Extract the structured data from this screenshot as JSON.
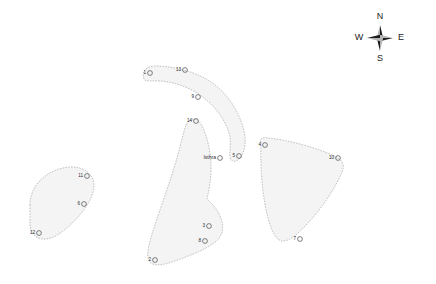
{
  "map": {
    "background_color": "#ffffff",
    "region_fill_color": "#f4f4f4",
    "region_stroke_color": "#a8a8a8",
    "marker_stroke_color": "#4a4a4a",
    "label_color": "#2a2a2a",
    "regions": [
      {
        "name": "west-oval-region",
        "path": "M 30 205 C 30 186 45 172 63 168 C 80 164 93 172 94 184 C 95 198 80 218 62 232 C 46 244 32 240 30 226 Z"
      },
      {
        "name": "north-arc-region",
        "path": "M 144 79 C 141 72 146 66 155 66 C 170 66 191 70 208 80 C 226 91 238 110 243 127 C 247 140 245 152 240 158 C 236 163 231 162 230 157 C 229 150 232 143 229 133 C 225 119 213 103 197 93 C 181 83 163 80 150 81 C 147 81 145 81 144 79 Z"
      },
      {
        "name": "central-peninsula-region",
        "path": "M 186 125 C 190 117 197 117 201 124 C 207 135 211 152 211 168 C 211 180 209 190 207 199 C 214 205 220 213 222 222 C 224 231 221 238 214 243 C 203 251 186 257 172 262 C 160 266 152 266 149 261 C 146 255 149 243 154 228 C 160 209 168 188 174 168 C 180 149 183 133 186 125 Z"
      },
      {
        "name": "east-triangle-region",
        "path": "M 261 142 C 259 139 262 137 268 138 C 288 140 315 147 334 156 C 343 160 345 165 342 172 C 336 187 322 208 308 223 C 297 235 288 242 282 241 C 276 240 272 232 268 218 C 263 199 260 172 261 142 Z"
      }
    ],
    "markers": [
      {
        "id": "1",
        "label": "1",
        "cx": 150,
        "cy": 73,
        "lx": 146,
        "ly": 73
      },
      {
        "id": "13",
        "label": "13",
        "cx": 185,
        "cy": 70,
        "lx": 181,
        "ly": 70
      },
      {
        "id": "9",
        "label": "9",
        "cx": 198,
        "cy": 97,
        "lx": 194,
        "ly": 97
      },
      {
        "id": "14",
        "label": "14",
        "cx": 196,
        "cy": 121,
        "lx": 192,
        "ly": 121
      },
      {
        "id": "5",
        "label": "5",
        "cx": 239,
        "cy": 156,
        "lx": 235,
        "ly": 156
      },
      {
        "id": "4",
        "label": "4",
        "cx": 265,
        "cy": 145,
        "lx": 261,
        "ly": 145
      },
      {
        "id": "10",
        "label": "10",
        "cx": 338,
        "cy": 158,
        "lx": 334,
        "ly": 158
      },
      {
        "id": "7",
        "label": "7",
        "cx": 300,
        "cy": 239,
        "lx": 296,
        "ly": 239
      },
      {
        "id": "11",
        "label": "11",
        "cx": 87,
        "cy": 176,
        "lx": 83,
        "ly": 176
      },
      {
        "id": "6",
        "label": "6",
        "cx": 84,
        "cy": 204,
        "lx": 80,
        "ly": 204
      },
      {
        "id": "12",
        "label": "12",
        "cx": 39,
        "cy": 233,
        "lx": 35,
        "ly": 233
      },
      {
        "id": "3",
        "label": "3",
        "cx": 209,
        "cy": 226,
        "lx": 205,
        "ly": 226
      },
      {
        "id": "8",
        "label": "8",
        "cx": 205,
        "cy": 241,
        "lx": 201,
        "ly": 241
      },
      {
        "id": "2",
        "label": "2",
        "cx": 155,
        "cy": 260,
        "lx": 151,
        "ly": 260
      }
    ],
    "place_labels": [
      {
        "id": "isthra",
        "label": "Isthra",
        "cx": 220,
        "cy": 158,
        "lx": 216,
        "ly": 158
      }
    ]
  },
  "compass": {
    "name": "compass-rose",
    "center_x": 380,
    "center_y": 38,
    "north_label": "N",
    "east_label": "E",
    "south_label": "S",
    "west_label": "W"
  }
}
